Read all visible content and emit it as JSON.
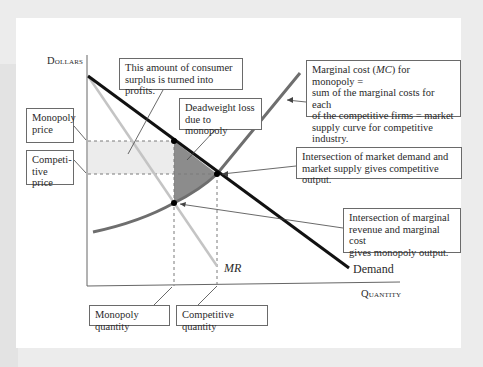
{
  "axes": {
    "y_label": "Dollars",
    "x_label": "Quantity"
  },
  "curves": {
    "demand_label": "Demand",
    "mr_label": "MR"
  },
  "annotations": {
    "consumer_surplus": "This amount of consumer surplus is turned into profits.",
    "consumer_surplus_line1": "This amount of consumer",
    "consumer_surplus_line2": "surplus is turned into profits.",
    "deadweight_line1": "Deadweight loss",
    "deadweight_line2": "due to monopoly",
    "mc_line1_pre": "Marginal cost (",
    "mc_line1_em": "MC",
    "mc_line1_post": ") for monopoly =",
    "mc_line2": "sum of the marginal costs for each",
    "mc_line3": "of the competitive firms = market",
    "mc_line4": "supply curve for competitive industry.",
    "competitive_line1": "Intersection of market demand and",
    "competitive_line2": "market supply gives competitive output.",
    "monopoly_out_line1": "Intersection of marginal",
    "monopoly_out_line2": "revenue and marginal cost",
    "monopoly_out_line3": "gives monopoly output.",
    "monopoly_price_line1": "Monopoly",
    "monopoly_price_line2": "price",
    "competitive_price_line1": "Competi-",
    "competitive_price_line2": "tive price",
    "monopoly_quantity": "Monopoly quantity",
    "competitive_quantity": "Competitive quantity"
  },
  "colors": {
    "demand": "#111111",
    "mr": "#c4c4c4",
    "mc": "#6e6e6e",
    "profit_area": "#ececec",
    "deadweight_area": "#8c8c8c",
    "axis": "#666666"
  }
}
